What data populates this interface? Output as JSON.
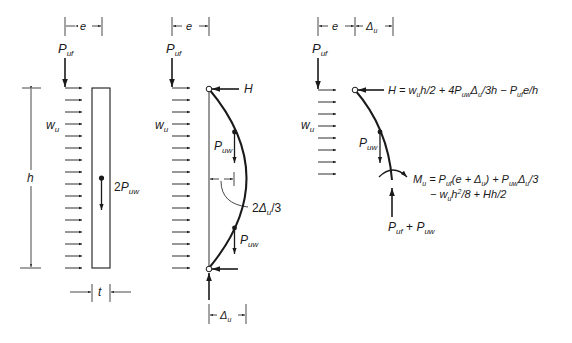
{
  "panels": [
    {
      "id": "free-body-wall",
      "labels": {
        "e": "e",
        "P_uf": "P",
        "P_uf_sub": "uf",
        "w_u": "w",
        "w_u_sub": "u",
        "h": "h",
        "self_weight_coef": "2",
        "self_weight": "P",
        "self_weight_sub": "uw",
        "t": "t"
      }
    },
    {
      "id": "deflected-shape",
      "labels": {
        "e": "e",
        "P_uf": "P",
        "P_uf_sub": "uf",
        "w_u": "w",
        "w_u_sub": "u",
        "H": "H",
        "P_uw_top": "P",
        "P_uw_top_sub": "uw",
        "P_uw_bot": "P",
        "P_uw_bot_sub": "uw",
        "two_delta_coef": "2",
        "two_delta": "Δ",
        "two_delta_sub": "u",
        "two_delta_tail": "/3",
        "delta": "Δ",
        "delta_sub": "u"
      }
    },
    {
      "id": "half-height-section",
      "labels": {
        "e": "e",
        "delta": "Δ",
        "delta_sub": "u",
        "P_uf": "P",
        "P_uf_sub": "uf",
        "w_u": "w",
        "w_u_sub": "u",
        "P_uw": "P",
        "P_uw_sub": "uw",
        "reaction": "P",
        "reaction_sub1": "uf",
        "reaction_plus": " + ",
        "reaction_P2": "P",
        "reaction_sub2": "uw"
      },
      "equations": {
        "H_eq": {
          "parts": [
            "H = w",
            "u",
            "h/2 + 4P",
            "uw",
            "Δ",
            "u",
            "/3h − P",
            "uf",
            "e/h"
          ]
        },
        "M_eq_line1": {
          "parts": [
            "M",
            "u",
            " = P",
            "uf",
            "(e + Δ",
            "u",
            ") + P",
            "uw",
            "Δ",
            "u",
            "/3"
          ]
        },
        "M_eq_line2": {
          "parts": [
            "− w",
            "u",
            "h",
            "2",
            "/8 + Hh/2"
          ]
        }
      }
    }
  ],
  "colors": {
    "ink": "#1a1a1a",
    "background": "#ffffff"
  }
}
